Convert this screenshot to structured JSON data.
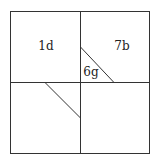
{
  "diagram": {
    "type": "square-dissection",
    "labels": [
      {
        "id": "region-1d",
        "text": "1d",
        "x": 46,
        "y": 50
      },
      {
        "id": "region-7b",
        "text": "7b",
        "x": 122,
        "y": 50
      },
      {
        "id": "region-6g",
        "text": "6g",
        "x": 91,
        "y": 76
      }
    ],
    "stroke_color": "#333333",
    "background": "#ffffff"
  }
}
